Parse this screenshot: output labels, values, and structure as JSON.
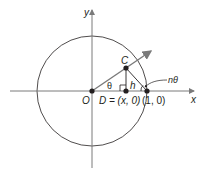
{
  "diagram": {
    "type": "unit-circle-geometry",
    "colors": {
      "ink": "#231f20",
      "arrow": "#7a7a7a",
      "background": "#ffffff"
    },
    "axes": {
      "x_label": "x",
      "y_label": "y"
    },
    "points": {
      "origin": {
        "label": "O"
      },
      "C": {
        "label": "C"
      },
      "D": {
        "label": "D = (x, 0)"
      },
      "unit": {
        "label": "(1, 0)"
      }
    },
    "labels": {
      "theta": "θ",
      "h": "h",
      "n_theta": "nθ"
    }
  }
}
